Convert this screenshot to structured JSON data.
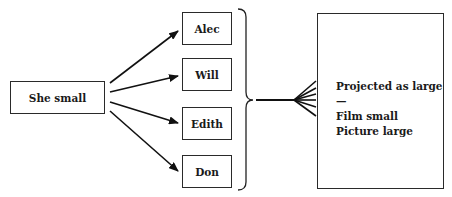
{
  "source": {
    "label": "She small"
  },
  "targets": [
    {
      "label": "Alec"
    },
    {
      "label": "Will"
    },
    {
      "label": "Edith"
    },
    {
      "label": "Don"
    }
  ],
  "result": {
    "lines": [
      "Projected as large—",
      "Film small",
      "Picture large"
    ]
  }
}
